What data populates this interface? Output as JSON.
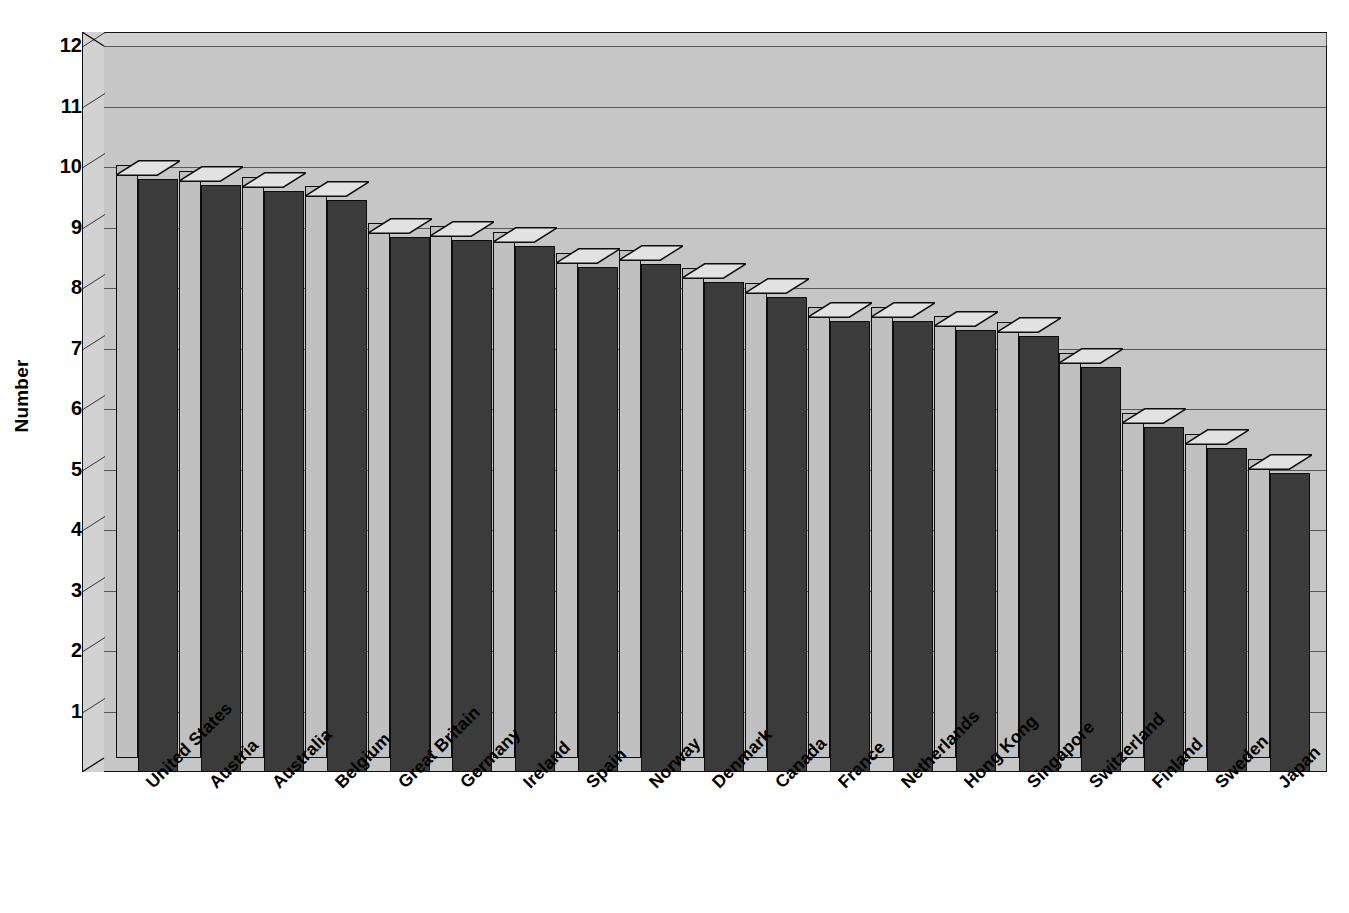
{
  "chart_data": {
    "type": "bar",
    "title": "",
    "xlabel": "",
    "ylabel": "Number",
    "ylim": [
      0,
      12
    ],
    "ytick_step": 1,
    "grid": true,
    "legend": "none",
    "style": "3d-column",
    "categories": [
      "United States",
      "Austria",
      "Australia",
      "Belgium",
      "Great Britain",
      "Germany",
      "Ireland",
      "Spain",
      "Norway",
      "Denmark",
      "Canada",
      "France",
      "Netherlands",
      "Hong Kong",
      "Singapore",
      "Switzerland",
      "Finland",
      "Sweden",
      "Japan"
    ],
    "values": [
      9.8,
      9.7,
      9.6,
      9.45,
      8.85,
      8.8,
      8.7,
      8.35,
      8.4,
      8.1,
      7.85,
      7.45,
      7.45,
      7.3,
      7.2,
      6.7,
      5.7,
      5.35,
      4.95
    ],
    "ytick_labels": [
      "12",
      "11",
      "10",
      "9",
      "8",
      "7",
      "6",
      "5",
      "4",
      "3",
      "2",
      "1"
    ],
    "ytick_values": [
      12,
      11,
      10,
      9,
      8,
      7,
      6,
      5,
      4,
      3,
      2,
      1
    ]
  },
  "colors": {
    "bar_fill": "#3b3b3b",
    "bar_side": "#c0c0c0",
    "plot_background": "#c6c6c6",
    "wall": "#d2d2d2",
    "gridline": "#585858",
    "outline": "#0d0d0d",
    "text": "#000000",
    "page_background": "#ffffff"
  }
}
